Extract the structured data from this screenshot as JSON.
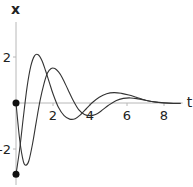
{
  "chart_data": {
    "type": "line",
    "title": "",
    "xlabel": "t",
    "ylabel": "x",
    "xlim": [
      0,
      8.9
    ],
    "ylim": [
      -3.3,
      3.4
    ],
    "grid": false,
    "legend": "none",
    "x_ticks": [
      {
        "value": 2,
        "label": "2"
      },
      {
        "value": 4,
        "label": "4"
      },
      {
        "value": 6,
        "label": "6"
      },
      {
        "value": 8,
        "label": "8"
      }
    ],
    "y_ticks": [
      {
        "value": 2,
        "label": "2"
      },
      {
        "value": -2,
        "label": "-2"
      }
    ],
    "initial_points": [
      {
        "t": 0,
        "x": 0
      },
      {
        "t": 0,
        "x": -3.1
      }
    ],
    "series": [
      {
        "name": "solution starting at x=0",
        "t": [
          0,
          0.2,
          0.4,
          0.55,
          0.7,
          0.9,
          1.1,
          1.3,
          1.5,
          1.7,
          1.9,
          2.1,
          2.3,
          2.5,
          2.8,
          3.1,
          3.4,
          3.7,
          4.0,
          4.3,
          4.6,
          5.0,
          5.4,
          5.8,
          6.2,
          6.6,
          7.0,
          7.5,
          8.0,
          8.5,
          8.9
        ],
        "x": [
          0,
          -1.6,
          -2.55,
          -2.7,
          -2.5,
          -1.75,
          -0.8,
          0.1,
          0.8,
          1.3,
          1.5,
          1.5,
          1.35,
          1.1,
          0.6,
          0.1,
          -0.3,
          -0.5,
          -0.55,
          -0.5,
          -0.35,
          -0.1,
          0.1,
          0.2,
          0.22,
          0.18,
          0.12,
          0.05,
          0.01,
          -0.01,
          -0.01
        ]
      },
      {
        "name": "solution starting at x=-3.1",
        "t": [
          0,
          0.2,
          0.4,
          0.6,
          0.8,
          1.0,
          1.2,
          1.4,
          1.6,
          1.8,
          2.0,
          2.3,
          2.6,
          2.9,
          3.2,
          3.5,
          3.8,
          4.1,
          4.5,
          4.9,
          5.3,
          5.7,
          6.1,
          6.5,
          7.0,
          7.5,
          8.0,
          8.5,
          8.9
        ],
        "x": [
          -3.1,
          -2.0,
          -0.6,
          0.7,
          1.6,
          2.05,
          2.1,
          1.85,
          1.4,
          0.9,
          0.4,
          -0.2,
          -0.55,
          -0.7,
          -0.68,
          -0.5,
          -0.25,
          0.0,
          0.25,
          0.4,
          0.45,
          0.42,
          0.35,
          0.25,
          0.12,
          0.04,
          0.0,
          -0.02,
          -0.02
        ]
      }
    ]
  }
}
